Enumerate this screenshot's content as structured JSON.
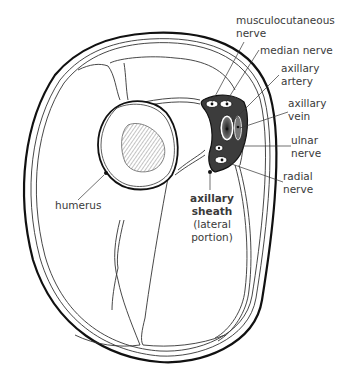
{
  "diagram": {
    "labels": {
      "musculocutaneous_nerve": [
        "musculocutaneous",
        "nerve"
      ],
      "median_nerve": "median nerve",
      "axillary_artery": [
        "axillary",
        "artery"
      ],
      "axillary_vein": [
        "axillary",
        "vein"
      ],
      "ulnar_nerve": [
        "ulnar",
        "nerve"
      ],
      "radial_nerve": [
        "radial",
        "nerve"
      ],
      "humerus": "humerus",
      "axillary_sheath": [
        "axillary",
        "sheath"
      ],
      "axillary_sheath_sub": [
        "(lateral",
        "portion)"
      ]
    },
    "colors": {
      "line": "#1a1a1a",
      "text": "#3a3a3a",
      "hatch": "#777777",
      "sheath_fill": "#444444",
      "background": "#ffffff"
    }
  }
}
